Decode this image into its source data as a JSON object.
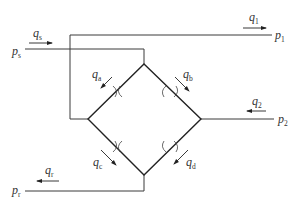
{
  "diagram": {
    "type": "hydraulic-bridge-circuit",
    "colors": {
      "line": "#3a3a3a",
      "text": "#333333",
      "background": "#ffffff"
    },
    "ports": [
      {
        "id": "ps",
        "base": "p",
        "sub": "s"
      },
      {
        "id": "p1",
        "base": "p",
        "sub": "1"
      },
      {
        "id": "p2",
        "base": "p",
        "sub": "2"
      },
      {
        "id": "pr",
        "base": "p",
        "sub": "r"
      }
    ],
    "flows": [
      {
        "id": "qs",
        "base": "q",
        "sub": "s",
        "direction": "right"
      },
      {
        "id": "q1",
        "base": "q",
        "sub": "1",
        "direction": "right"
      },
      {
        "id": "q2",
        "base": "q",
        "sub": "2",
        "direction": "left"
      },
      {
        "id": "qr",
        "base": "q",
        "sub": "r",
        "direction": "left"
      },
      {
        "id": "qa",
        "base": "q",
        "sub": "a",
        "direction": "down-left"
      },
      {
        "id": "qb",
        "base": "q",
        "sub": "b",
        "direction": "down-right"
      },
      {
        "id": "qc",
        "base": "q",
        "sub": "c",
        "direction": "down-right"
      },
      {
        "id": "qd",
        "base": "q",
        "sub": "d",
        "direction": "down-left"
      }
    ],
    "orifices": [
      "a",
      "b",
      "c",
      "d"
    ]
  }
}
